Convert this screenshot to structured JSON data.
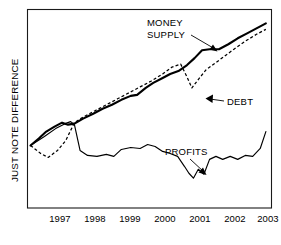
{
  "chart_data": {
    "type": "line",
    "title": "",
    "xlabel": "",
    "ylabel": "JUST NOTE DIFFERENCE",
    "x": [
      1997,
      1998,
      1999,
      2000,
      2001,
      2002,
      2003
    ],
    "tick_labels": [
      "1997",
      "1998",
      "1999",
      "2000",
      "2001",
      "2002",
      "2003"
    ],
    "xlim": [
      1996.7,
      2003.2
    ],
    "ylim": [
      0,
      100
    ],
    "grid": false,
    "legend": "annotations-with-arrows",
    "axes_numeric_y": false,
    "series": [
      {
        "name": "MONEY SUPPLY",
        "style": "solid-thick",
        "color": "#000000",
        "x": [
          1996.78,
          1997.0,
          1997.2,
          1997.42,
          1997.62,
          1997.78,
          1997.95,
          1998.18,
          1998.45,
          1998.7,
          1998.95,
          1999.2,
          1999.45,
          1999.62,
          1999.85,
          2000.05,
          2000.3,
          2000.5,
          2000.72,
          2000.95,
          2001.15,
          2001.35,
          2001.55,
          2001.8,
          2002.05,
          2002.3,
          2002.55,
          2002.8,
          2003.05
        ],
        "y": [
          31.5,
          35.0,
          38.5,
          41.0,
          43.0,
          42.0,
          42.5,
          45.0,
          47.5,
          50.0,
          52.0,
          54.5,
          56.5,
          57.0,
          60.5,
          63.0,
          65.5,
          67.5,
          69.0,
          72.0,
          75.5,
          79.5,
          80.0,
          80.0,
          82.5,
          85.5,
          88.0,
          90.5,
          93.0
        ]
      },
      {
        "name": "DEBT",
        "style": "dashed",
        "color": "#000000",
        "x": [
          1996.78,
          1997.05,
          1997.25,
          1997.5,
          1997.72,
          1997.95,
          1998.2,
          1998.5,
          1998.8,
          1999.1,
          1999.4,
          1999.7,
          2000.0,
          2000.3,
          2000.55,
          2000.78,
          2000.95,
          2001.08,
          2001.22,
          2001.45,
          2001.7,
          2001.95,
          2002.2,
          2002.5,
          2002.8,
          2003.05
        ],
        "y": [
          31.5,
          27.5,
          25.5,
          29.0,
          34.0,
          43.0,
          46.0,
          49.0,
          52.0,
          55.0,
          58.0,
          61.0,
          64.0,
          67.5,
          71.0,
          72.5,
          66.0,
          60.5,
          64.0,
          69.5,
          73.0,
          76.5,
          80.0,
          84.0,
          87.5,
          90.0
        ]
      },
      {
        "name": "PROFITS",
        "style": "solid-thin",
        "color": "#000000",
        "x": [
          1996.78,
          1997.15,
          1997.45,
          1997.7,
          1997.85,
          1997.95,
          1998.1,
          1998.3,
          1998.55,
          1998.8,
          1999.0,
          1999.2,
          1999.45,
          1999.7,
          1999.9,
          2000.1,
          2000.3,
          2000.5,
          2000.7,
          2000.88,
          2001.0,
          2001.12,
          2001.25,
          2001.4,
          2001.55,
          2001.72,
          2001.9,
          2002.1,
          2002.3,
          2002.5,
          2002.7,
          2002.9,
          2003.05
        ],
        "y": [
          31.5,
          36.0,
          40.0,
          42.5,
          43.5,
          42.0,
          29.0,
          26.5,
          26.0,
          27.0,
          26.0,
          29.5,
          30.5,
          30.0,
          32.0,
          31.0,
          28.5,
          27.5,
          26.0,
          21.0,
          17.5,
          15.0,
          19.5,
          17.0,
          24.5,
          26.0,
          24.5,
          26.0,
          24.5,
          26.5,
          26.0,
          30.0,
          38.5
        ]
      }
    ],
    "annotations": [
      {
        "id": "money-supply",
        "lines": [
          "MONEY",
          "SUPPLY"
        ],
        "text": "MONEY SUPPLY",
        "target_series": "MONEY SUPPLY",
        "arrow_direction": "down-right"
      },
      {
        "id": "debt",
        "lines": [
          "DEBT"
        ],
        "text": "DEBT",
        "target_series": "DEBT",
        "arrow_direction": "left"
      },
      {
        "id": "profits",
        "lines": [
          "PROFITS"
        ],
        "text": "PROFITS",
        "target_series": "PROFITS",
        "arrow_direction": "down-right"
      }
    ]
  }
}
